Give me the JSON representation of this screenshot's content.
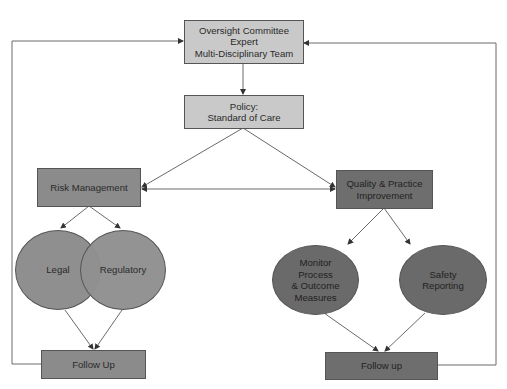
{
  "diagram": {
    "nodes": {
      "oversight": {
        "lines": [
          "Oversight Committee",
          "Expert",
          "Multi-Disciplinary Team"
        ],
        "shape": "rectangle",
        "fill": "#c9c9c9"
      },
      "policy": {
        "lines": [
          "Policy:",
          "Standard of Care"
        ],
        "shape": "rectangle",
        "fill": "#c9c9c9"
      },
      "risk_management": {
        "label": "Risk Management",
        "shape": "rectangle",
        "fill": "#8b8b8b"
      },
      "quality_improvement": {
        "lines": [
          "Quality & Practice",
          "Improvement"
        ],
        "shape": "rectangle",
        "fill": "#6e6e6e"
      },
      "legal": {
        "label": "Legal",
        "shape": "ellipse",
        "fill": "#8f8f8f"
      },
      "regulatory": {
        "label": "Regulatory",
        "shape": "ellipse",
        "fill": "#8f8f8f"
      },
      "monitor": {
        "lines": [
          "Monitor",
          "Process",
          "& Outcome",
          "Measures"
        ],
        "shape": "ellipse",
        "fill": "#6a6a6a"
      },
      "safety_reporting": {
        "lines": [
          "Safety",
          "Reporting"
        ],
        "shape": "ellipse",
        "fill": "#6a6a6a"
      },
      "follow_up_left": {
        "label": "Follow Up",
        "shape": "rectangle",
        "fill": "#8b8b8b"
      },
      "follow_up_right": {
        "label": "Follow up",
        "shape": "rectangle",
        "fill": "#6e6e6e"
      }
    },
    "edges": [
      {
        "from": "oversight",
        "to": "policy"
      },
      {
        "from": "policy",
        "to": "risk_management"
      },
      {
        "from": "policy",
        "to": "quality_improvement"
      },
      {
        "from": "risk_management",
        "to": "quality_improvement",
        "bidirectional": true
      },
      {
        "from": "risk_management",
        "to": "legal"
      },
      {
        "from": "risk_management",
        "to": "regulatory"
      },
      {
        "from": "quality_improvement",
        "to": "monitor"
      },
      {
        "from": "quality_improvement",
        "to": "safety_reporting"
      },
      {
        "from": "legal",
        "to": "follow_up_left"
      },
      {
        "from": "regulatory",
        "to": "follow_up_left"
      },
      {
        "from": "monitor",
        "to": "follow_up_right"
      },
      {
        "from": "safety_reporting",
        "to": "follow_up_right"
      },
      {
        "from": "follow_up_left",
        "to": "oversight",
        "route": "left loop"
      },
      {
        "from": "follow_up_right",
        "to": "oversight",
        "route": "right loop"
      }
    ],
    "colors": {
      "line": "#6a6a6a",
      "border": "#555555",
      "text": "#2a2a2a"
    }
  }
}
